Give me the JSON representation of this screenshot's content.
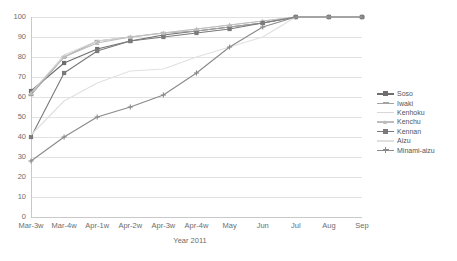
{
  "chart_data": {
    "type": "line",
    "title": "",
    "xlabel": "Year 2011",
    "ylabel": "",
    "categories": [
      "Mar-3w",
      "Mar-4w",
      "Apr-1w",
      "Apr-2w",
      "Apr-3w",
      "Apr-4w",
      "May",
      "Jun",
      "Jul",
      "Aug",
      "Sep"
    ],
    "ylim": [
      0,
      100
    ],
    "ytick_labels": [
      "0",
      "10",
      "20",
      "30",
      "40",
      "50",
      "60",
      "70",
      "80",
      "90",
      "100"
    ],
    "ytick_values": [
      0,
      10,
      20,
      30,
      40,
      50,
      60,
      70,
      80,
      90,
      100
    ],
    "grid": "horizontal",
    "legend_position": "right",
    "series": [
      {
        "name": "Soso",
        "color": "#6e6e6e",
        "marker": "square",
        "values": [
          63,
          77,
          84,
          88,
          91,
          93,
          95,
          97,
          100,
          100,
          100
        ]
      },
      {
        "name": "Iwaki",
        "color": "#a3a3a3",
        "marker": "dash",
        "values": [
          61,
          80,
          88,
          90,
          92,
          93,
          95,
          97,
          100,
          100,
          100
        ]
      },
      {
        "name": "Kenhoku",
        "color": "#d8d8d8",
        "marker": "none",
        "values": [
          62,
          81,
          88,
          90,
          92,
          94,
          96,
          98,
          100,
          100,
          100
        ]
      },
      {
        "name": "Kenchu",
        "color": "#bdbdbd",
        "marker": "triangle",
        "values": [
          62,
          80,
          87,
          90,
          92,
          94,
          96,
          98,
          100,
          100,
          100
        ]
      },
      {
        "name": "Kennan",
        "color": "#7a7a7a",
        "marker": "square",
        "values": [
          40,
          72,
          83,
          88,
          90,
          92,
          94,
          97,
          100,
          100,
          100
        ]
      },
      {
        "name": "Aizu",
        "color": "#e0e0e0",
        "marker": "none",
        "values": [
          41,
          58,
          67,
          73,
          74,
          80,
          85,
          90,
          100,
          100,
          100
        ]
      },
      {
        "name": "Minami-aizu",
        "color": "#8a8a8a",
        "marker": "plus",
        "values": [
          28,
          40,
          50,
          55,
          61,
          72,
          85,
          95,
          100,
          100,
          100
        ]
      }
    ]
  },
  "legend": {
    "items": [
      {
        "label": "Soso"
      },
      {
        "label": "Iwaki"
      },
      {
        "label": "Kenhoku"
      },
      {
        "label": "Kenchu"
      },
      {
        "label": "Kennan"
      },
      {
        "label": "Aizu"
      },
      {
        "label": "Minami-aizu"
      }
    ]
  }
}
